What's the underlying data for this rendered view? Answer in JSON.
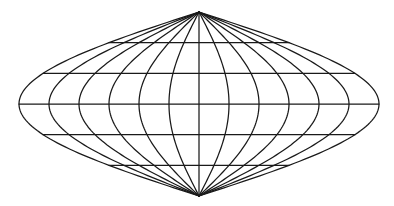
{
  "figure": {
    "projection": "sinusoidal",
    "colors": {
      "background": "#ffffff",
      "line": "#1a1a1a"
    },
    "geometry": {
      "center_x": 199,
      "equator_y": 104,
      "north_pole_y": 12,
      "south_pole_y": 196,
      "half_width": 180
    },
    "meridians_deg": [
      -180,
      -150,
      -120,
      -90,
      -60,
      -30,
      0,
      30,
      60,
      90,
      120,
      150,
      180
    ],
    "parallels_deg": [
      60,
      30,
      0,
      -30,
      -60
    ]
  }
}
